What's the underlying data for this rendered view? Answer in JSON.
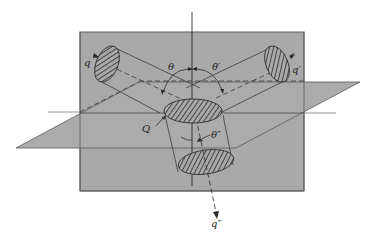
{
  "diagram": {
    "type": "3D flow geometry — three cylinders meeting at an interface plane",
    "colors": {
      "plane_fill": "#a9a9a9",
      "plane_edge": "#5a5a5a",
      "line": "#3a3a3a",
      "hatch": "#2a2a2a",
      "background": "#ffffff"
    },
    "labels": {
      "q": "q",
      "q_prime": "q′",
      "q_double_prime": "q″",
      "Q": "Q",
      "theta": "θ",
      "theta_prime": "θ′",
      "theta_double_prime": "θ″"
    },
    "elements": [
      {
        "name": "vertical-plane",
        "desc": "gray vertical rectangle"
      },
      {
        "name": "horizontal-plane",
        "desc": "gray parallelogram crossing the vertical plane"
      },
      {
        "name": "vertical-axis",
        "desc": "normal line through center"
      },
      {
        "name": "incident-cylinder-left",
        "label": "q",
        "angle": "θ"
      },
      {
        "name": "incident-cylinder-right",
        "label": "q′",
        "angle": "θ′"
      },
      {
        "name": "transmitted-cylinder-bottom",
        "label": "q″",
        "angle": "θ″"
      },
      {
        "name": "central-cross-section",
        "label": "Q"
      }
    ]
  }
}
